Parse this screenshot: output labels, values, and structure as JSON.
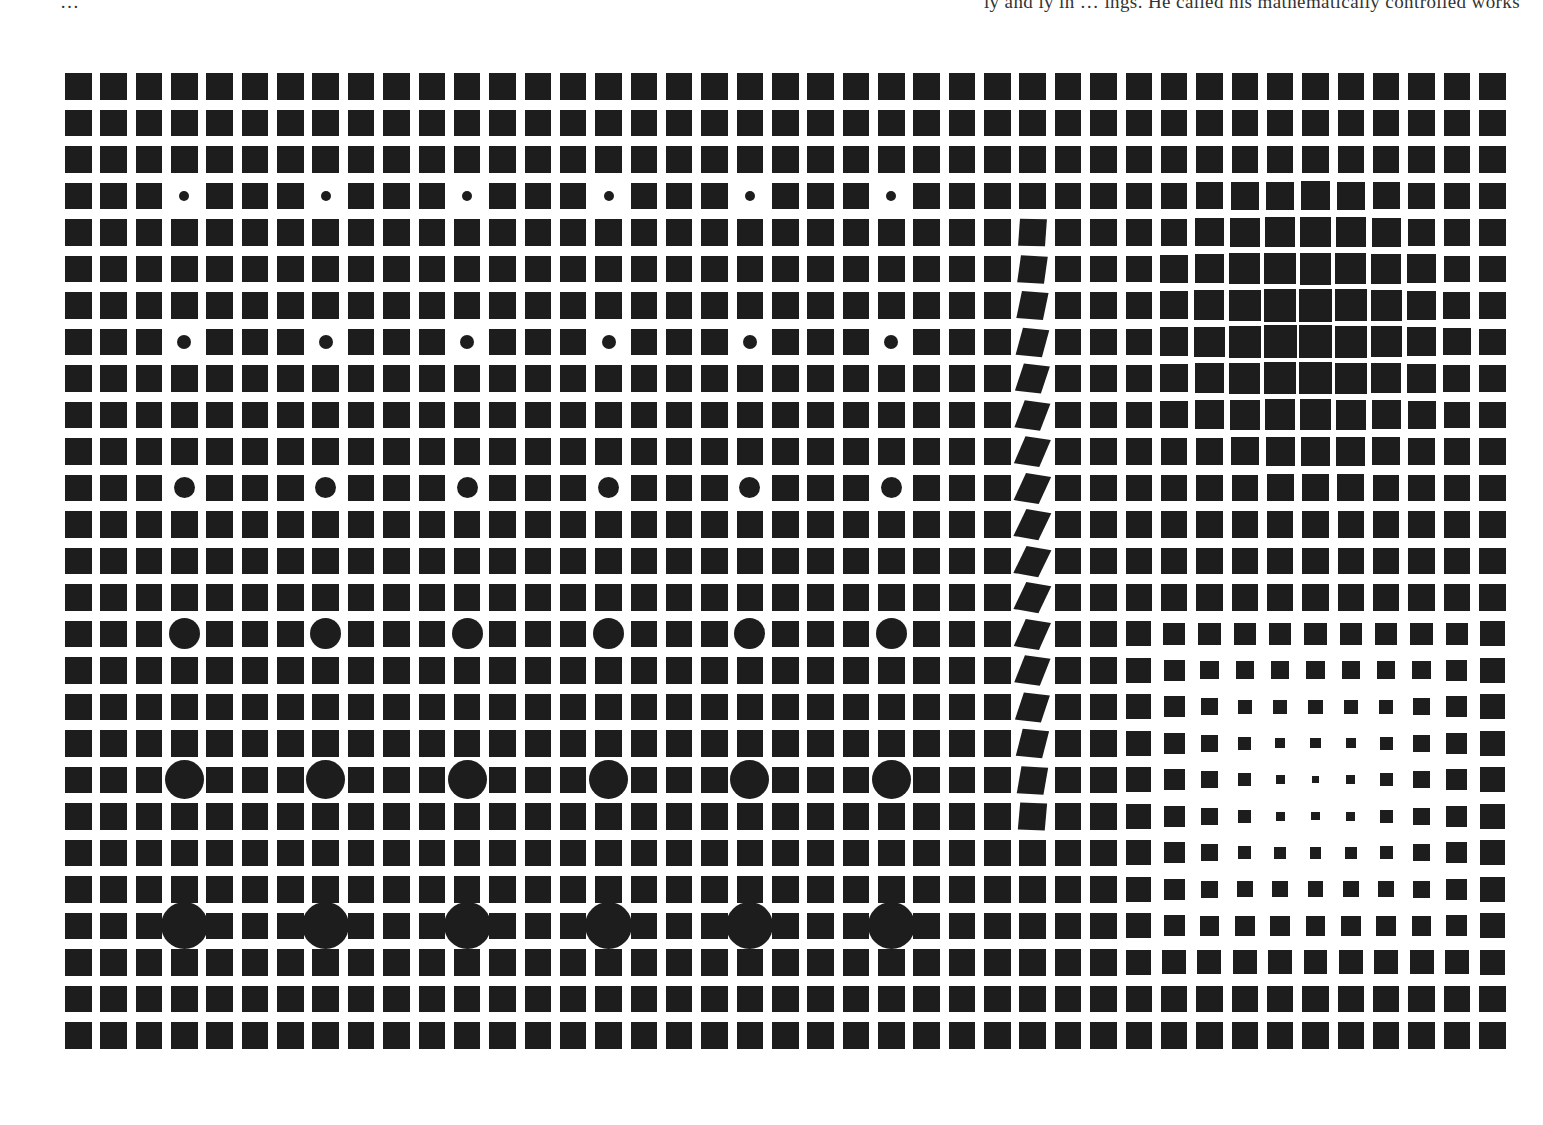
{
  "caption": {
    "left_fragment": "…",
    "right_fragment": "ly and ly in … ings. He called his mathematically controlled works"
  },
  "artwork": {
    "type": "op-art square grid",
    "colors": {
      "ink": "#1d1d1d",
      "paper": "#ffffff"
    },
    "grid": {
      "columns": 41,
      "rows": 27,
      "origin_x": 65,
      "origin_y": 73,
      "pitch_x": 35.35,
      "pitch_y": 36.5,
      "square_size": 26.5
    },
    "circles": {
      "columns": [
        3,
        7,
        11,
        15,
        19,
        23
      ],
      "rows": [
        {
          "row": 3,
          "diameter": 10
        },
        {
          "row": 7,
          "diameter": 14
        },
        {
          "row": 11,
          "diameter": 21
        },
        {
          "row": 15,
          "diameter": 31
        },
        {
          "row": 19,
          "diameter": 39
        },
        {
          "row": 23,
          "diameter": 47
        }
      ]
    },
    "distorted_column": {
      "column": 27,
      "row_start": 3,
      "row_end": 21,
      "peak_row": 13,
      "max_skew_deg": 26,
      "max_tilt_deg": 9
    },
    "dark_zone": {
      "center_col": 34.7,
      "center_row": 6.7,
      "radius": 4.6,
      "max_size": 34
    },
    "light_zone": {
      "center_col": 35,
      "center_row": 19.3,
      "radius": 5.3,
      "min_size": 6
    }
  }
}
